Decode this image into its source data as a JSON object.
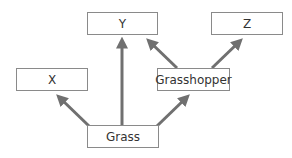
{
  "diagram": {
    "type": "food-web",
    "colors": {
      "arrow": "#707070",
      "box_border": "#8a8a8a",
      "text": "#333333"
    },
    "nodes": [
      {
        "id": "y",
        "label": "Y",
        "x": 87,
        "y": 12,
        "w": 71,
        "h": 23
      },
      {
        "id": "z",
        "label": "Z",
        "x": 211,
        "y": 12,
        "w": 72,
        "h": 23
      },
      {
        "id": "x",
        "label": "X",
        "x": 16,
        "y": 68,
        "w": 72,
        "h": 23
      },
      {
        "id": "grasshopper",
        "label": "Grasshopper",
        "x": 157,
        "y": 68,
        "w": 73,
        "h": 23
      },
      {
        "id": "grass",
        "label": "Grass",
        "x": 87,
        "y": 125,
        "w": 72,
        "h": 23
      }
    ],
    "edges": [
      {
        "from": "Grass",
        "to": "X"
      },
      {
        "from": "Grass",
        "to": "Y"
      },
      {
        "from": "Grass",
        "to": "Grasshopper"
      },
      {
        "from": "Grasshopper",
        "to": "Y"
      },
      {
        "from": "Grasshopper",
        "to": "Z"
      }
    ]
  }
}
